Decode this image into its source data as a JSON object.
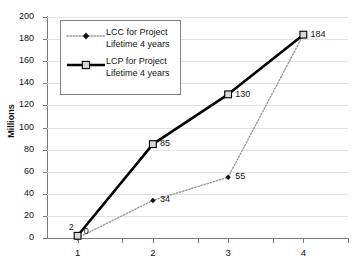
{
  "chart_data": {
    "type": "line",
    "title": "",
    "xlabel": "",
    "ylabel": "Millions",
    "categories": [
      "1",
      "2",
      "3",
      "4"
    ],
    "ylim": [
      0,
      200
    ],
    "ytick_values": [
      0,
      20,
      40,
      60,
      80,
      100,
      120,
      140,
      160,
      180,
      200
    ],
    "grid": true,
    "legend_position": "top-left-inside",
    "series": [
      {
        "name": "LCC for Project Lifetime 4 years",
        "values": [
          0,
          34,
          55,
          184
        ],
        "labels": [
          "0",
          "34",
          "55",
          "184"
        ],
        "line_style": "dotted",
        "marker": "diamond",
        "color": "#111111"
      },
      {
        "name": "LCP for Project Lifetime 4 years",
        "values": [
          2,
          85,
          130,
          184
        ],
        "labels": [
          "2",
          "85",
          "130",
          "184"
        ],
        "line_style": "solid",
        "marker": "open-square",
        "color": "#000000"
      }
    ]
  },
  "axes": {
    "y_title": "Millions",
    "y_ticks": [
      "200",
      "180",
      "160",
      "140",
      "120",
      "100",
      "80",
      "60",
      "40",
      "20",
      "0"
    ],
    "x_ticks": [
      "1",
      "2",
      "3",
      "4"
    ]
  },
  "legend": {
    "entries": [
      {
        "label": "LCC for Project\nLifetime 4 years",
        "marker": "diamond-dotted"
      },
      {
        "label": "LCP for Project\nLifetime 4 years",
        "marker": "square-solid"
      }
    ]
  },
  "data_labels": {
    "lcp_1": "2",
    "lcc_1": "0",
    "lcp_2": "85",
    "lcc_2": "34",
    "lcp_3": "130",
    "lcc_3": "55",
    "shared_4": "184"
  },
  "colors": {
    "lcp_line": "#000000",
    "lcc_line": "#9a9a9a",
    "grid": "#e2e2e2",
    "axis": "#7b7b7b",
    "text": "#131313",
    "background": "#ffffff"
  }
}
